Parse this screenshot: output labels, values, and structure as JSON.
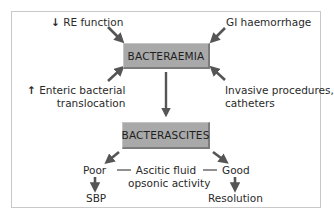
{
  "diagram": {
    "central_node": "BACTERAEMIA",
    "secondary_node": "BACTERASCITES",
    "inputs": {
      "top_left": {
        "arrow": "↓",
        "text": "RE function"
      },
      "top_right": {
        "text": "GI haemorrhage"
      },
      "bottom_left": {
        "arrow": "↑",
        "line1": "Enteric bacterial",
        "line2": "translocation"
      },
      "bottom_right": {
        "line1": "Invasive procedures,",
        "line2": "catheters"
      }
    },
    "modifier": {
      "line1": "Ascitic fluid",
      "line2": "opsonic activity"
    },
    "branches": {
      "poor": {
        "label": "Poor",
        "outcome": "SBP"
      },
      "good": {
        "label": "Good",
        "outcome": "Resolution"
      }
    },
    "colors": {
      "box_fill": "#a9a9a9",
      "box_shadow": "#7c7c7c",
      "arrow": "#555555",
      "frame": "#c9c9c9"
    }
  }
}
